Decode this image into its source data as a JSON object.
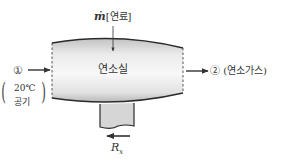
{
  "diagram": {
    "chamber_label": "연소실",
    "fuel_label_symbol": "ṁ",
    "fuel_label_text": "[연료]",
    "inlet_state": "①",
    "inlet_condition_line1": "20℃",
    "inlet_condition_line2": "공기",
    "outlet_state": "②",
    "outlet_label": "(연소가스)",
    "reaction_force_symbol": "R",
    "reaction_force_subscript": "x"
  },
  "colors": {
    "outline": "#2a2a2a",
    "chamber_fill_light": "#f4f4f4",
    "chamber_fill_dark": "#bdbdbd",
    "support_fill": "#d6d6d6",
    "arrow": "#333333",
    "text": "#333333"
  }
}
